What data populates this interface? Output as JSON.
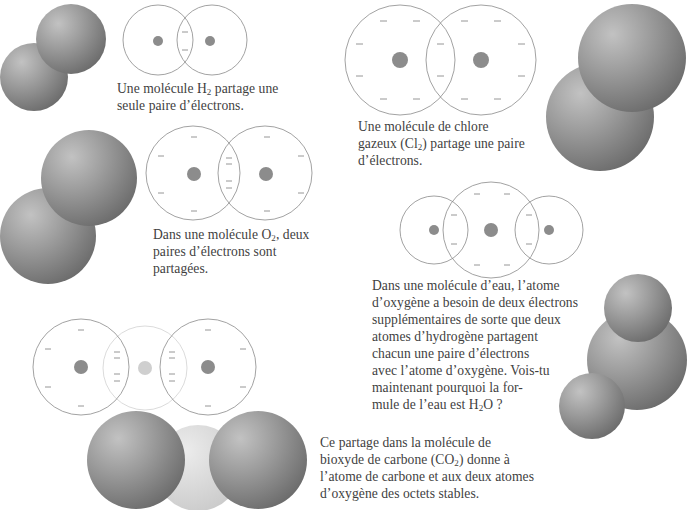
{
  "page": {
    "language": "fr",
    "background": "#ffffff"
  },
  "colors": {
    "orbit_stroke": "#8a8a8a",
    "orbit_stroke_light": "#d0d0d0",
    "nucleus": "#8c8c8c",
    "nucleus_light": "#cfcfcf",
    "electron": "#8a8a8a",
    "sphere_dark": "#6a6a6a",
    "sphere_mid": "#9a9a9a",
    "sphere_light": "#c4c4c4",
    "carbon_sphere": "#dcdcdc",
    "text": "#3f3f3f"
  },
  "molecules": {
    "h2": {
      "name": "H2",
      "caption_lines": [
        {
          "pre": "Une molécule H",
          "sub": "2",
          "post": " partage une"
        },
        {
          "pre": "seule paire d’électrons.",
          "sub": "",
          "post": ""
        }
      ],
      "shared_pairs": 1
    },
    "cl2": {
      "name": "Cl2",
      "caption_lines": [
        {
          "pre": "Une molécule de chlore",
          "sub": "",
          "post": ""
        },
        {
          "pre": "gazeux (Cl",
          "sub": "2",
          "post": ") partage une paire"
        },
        {
          "pre": "d’électrons.",
          "sub": "",
          "post": ""
        }
      ],
      "shared_pairs": 1
    },
    "o2": {
      "name": "O2",
      "caption_lines": [
        {
          "pre": "Dans une molécule O",
          "sub": "2",
          "post": ", deux"
        },
        {
          "pre": "paires d’électrons sont",
          "sub": "",
          "post": ""
        },
        {
          "pre": "partagées.",
          "sub": "",
          "post": ""
        }
      ],
      "shared_pairs": 2
    },
    "h2o": {
      "name": "H2O",
      "caption_lines": [
        {
          "pre": "Dans une molécule d’eau, l’atome",
          "sub": "",
          "post": ""
        },
        {
          "pre": "d’oxygène a besoin de deux électrons",
          "sub": "",
          "post": ""
        },
        {
          "pre": "supplémentaires de sorte que deux",
          "sub": "",
          "post": ""
        },
        {
          "pre": "atomes d’hydrogène partagent",
          "sub": "",
          "post": ""
        },
        {
          "pre": "chacun une paire d’électrons",
          "sub": "",
          "post": ""
        },
        {
          "pre": "avec l’atome d’oxygène. Vois-tu",
          "sub": "",
          "post": ""
        },
        {
          "pre": "maintenant pourquoi la for-",
          "sub": "",
          "post": ""
        },
        {
          "pre": "mule de l’eau est H",
          "sub": "2",
          "post": "O ?"
        }
      ],
      "shared_pairs": 2
    },
    "co2": {
      "name": "CO2",
      "caption_lines": [
        {
          "pre": "Ce partage dans la molécule de",
          "sub": "",
          "post": ""
        },
        {
          "pre": "bioxyde de carbone (CO",
          "sub": "2",
          "post": ") donne à"
        },
        {
          "pre": "l’atome de carbone et aux deux atomes",
          "sub": "",
          "post": ""
        },
        {
          "pre": "d’oxygène des octets stables.",
          "sub": "",
          "post": ""
        }
      ],
      "shared_pairs": 4
    }
  }
}
